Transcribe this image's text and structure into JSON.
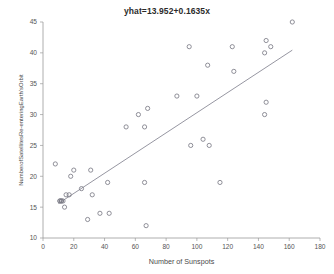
{
  "chart_data": {
    "type": "scatter",
    "title": "yhat=13.952+0.1635x",
    "xlabel": "Number of Sunspots",
    "ylabel": "NumberofSatellitesRe-enteringEarth'sOrbit",
    "xlim": [
      0,
      180
    ],
    "ylim": [
      10,
      45
    ],
    "xticks": [
      0,
      20,
      40,
      60,
      80,
      100,
      120,
      140,
      160,
      180
    ],
    "yticks": [
      10,
      15,
      20,
      25,
      30,
      35,
      40,
      45
    ],
    "grid": false,
    "legend": null,
    "marker_style": "open-circle",
    "marker_color": "#7c7c86",
    "line_color": "#8a8a96",
    "points": [
      {
        "x": 8,
        "y": 22
      },
      {
        "x": 11,
        "y": 16
      },
      {
        "x": 11,
        "y": 16
      },
      {
        "x": 12,
        "y": 16
      },
      {
        "x": 12,
        "y": 16
      },
      {
        "x": 13,
        "y": 16
      },
      {
        "x": 14,
        "y": 15
      },
      {
        "x": 15,
        "y": 17
      },
      {
        "x": 17,
        "y": 17
      },
      {
        "x": 18,
        "y": 20
      },
      {
        "x": 20,
        "y": 21
      },
      {
        "x": 25,
        "y": 18
      },
      {
        "x": 29,
        "y": 13
      },
      {
        "x": 31,
        "y": 21
      },
      {
        "x": 32,
        "y": 17
      },
      {
        "x": 37,
        "y": 14
      },
      {
        "x": 42,
        "y": 19
      },
      {
        "x": 43,
        "y": 14
      },
      {
        "x": 54,
        "y": 28
      },
      {
        "x": 62,
        "y": 30
      },
      {
        "x": 66,
        "y": 28
      },
      {
        "x": 66,
        "y": 19
      },
      {
        "x": 67,
        "y": 12
      },
      {
        "x": 68,
        "y": 31
      },
      {
        "x": 87,
        "y": 33
      },
      {
        "x": 95,
        "y": 41
      },
      {
        "x": 96,
        "y": 25
      },
      {
        "x": 100,
        "y": 33
      },
      {
        "x": 104,
        "y": 26
      },
      {
        "x": 107,
        "y": 38
      },
      {
        "x": 108,
        "y": 25
      },
      {
        "x": 115,
        "y": 19
      },
      {
        "x": 123,
        "y": 41
      },
      {
        "x": 124,
        "y": 37
      },
      {
        "x": 144,
        "y": 40
      },
      {
        "x": 144,
        "y": 30
      },
      {
        "x": 145,
        "y": 42
      },
      {
        "x": 145,
        "y": 32
      },
      {
        "x": 148,
        "y": 41
      },
      {
        "x": 162,
        "y": 45
      }
    ],
    "fit_line": {
      "equation": "yhat=13.952+0.1635x",
      "intercept": 13.952,
      "slope": 0.1635,
      "x_start": 10,
      "x_end": 162
    }
  }
}
